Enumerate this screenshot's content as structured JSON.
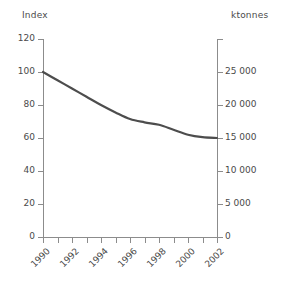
{
  "chart_data": {
    "type": "line",
    "title": "",
    "subtitle": "",
    "xlabel": "",
    "ylabel": "Index",
    "y2label": "ktonnes",
    "grid": false,
    "legend": "none",
    "x": [
      1990,
      1991,
      1992,
      1993,
      1994,
      1995,
      1996,
      1997,
      1998,
      1999,
      2000,
      2001,
      2002
    ],
    "categories": [
      "1990",
      "1991",
      "1992",
      "1993",
      "1994",
      "1995",
      "1996",
      "1997",
      "1998",
      "1999",
      "2000",
      "2001",
      "2002"
    ],
    "series": [
      {
        "name": "Index",
        "values": [
          100.0,
          95.0,
          90.0,
          85.0,
          80.0,
          75.5,
          71.5,
          69.5,
          68.0,
          65.0,
          62.0,
          60.5,
          60.0
        ]
      }
    ],
    "ylim": [
      0,
      120
    ],
    "y2lim": [
      0,
      30000
    ],
    "yticks": [
      0,
      20,
      40,
      60,
      80,
      100,
      120
    ],
    "ytick_labels": [
      "0",
      "20",
      "40",
      "60",
      "80",
      "100",
      "120"
    ],
    "y2ticks": [
      0,
      5000,
      10000,
      15000,
      20000,
      25000,
      30000
    ],
    "y2tick_labels": [
      "0",
      "5 000",
      "10 000",
      "15 000",
      "20 000",
      "25 000",
      ""
    ],
    "xtick_labels": [
      "1990",
      "",
      "1992",
      "",
      "1994",
      "",
      "1996",
      "",
      "1998",
      "",
      "2000",
      "",
      "2002"
    ],
    "line_color": "#4d4d4d",
    "axis_color": "#8c8c8c",
    "text_color": "#4a4a4a"
  },
  "axes": {
    "left_title": "Index",
    "right_title": "ktonnes"
  }
}
